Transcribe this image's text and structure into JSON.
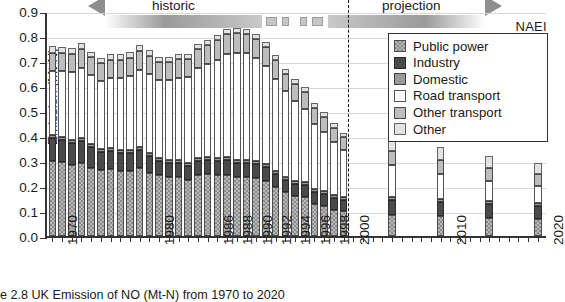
{
  "chart_data": {
    "type": "bar",
    "stacked": true,
    "xlabel": "",
    "ylabel": "Emission (Mt-N)",
    "ylim": [
      0.0,
      0.9
    ],
    "ytick_labels": [
      "0.0",
      "0.1",
      "0.2",
      "0.3",
      "0.4",
      "0.5",
      "0.6",
      "0.7",
      "0.8",
      "0.9"
    ],
    "ytick_values": [
      0.0,
      0.1,
      0.2,
      0.3,
      0.4,
      0.5,
      0.6,
      0.7,
      0.8,
      0.9
    ],
    "grid": true,
    "legend_position": "top-right",
    "series_order": [
      "Public power",
      "Industry",
      "Domestic",
      "Road transport",
      "Other transport",
      "Other"
    ],
    "series_colors": {
      "Public power": "#b8b8b8",
      "Industry": "#4a4a4a",
      "Domestic": "#9a9a9a",
      "Road transport": "#ffffff",
      "Other transport": "#bdbdbd",
      "Other": "#e2e2e2"
    },
    "x": [
      1970,
      1971,
      1972,
      1973,
      1974,
      1975,
      1976,
      1977,
      1978,
      1979,
      1980,
      1981,
      1982,
      1983,
      1984,
      1985,
      1986,
      1987,
      1988,
      1989,
      1990,
      1991,
      1992,
      1993,
      1994,
      1995,
      1996,
      1997,
      1998,
      1999,
      2000,
      2005,
      2010,
      2015,
      2020
    ],
    "xtick_labels": [
      "1970",
      "1980",
      "1986",
      "1988",
      "1990",
      "1992",
      "1994",
      "1996",
      "1998",
      "2000",
      "2010",
      "2020"
    ],
    "series": [
      {
        "name": "Public power",
        "values": [
          0.3,
          0.298,
          0.286,
          0.292,
          0.274,
          0.264,
          0.268,
          0.262,
          0.262,
          0.272,
          0.253,
          0.243,
          0.236,
          0.235,
          0.226,
          0.243,
          0.248,
          0.245,
          0.245,
          0.238,
          0.235,
          0.234,
          0.222,
          0.198,
          0.176,
          0.16,
          0.156,
          0.128,
          0.12,
          0.105,
          0.1,
          0.085,
          0.08,
          0.072,
          0.068
        ]
      },
      {
        "name": "Industry",
        "values": [
          0.092,
          0.088,
          0.086,
          0.088,
          0.082,
          0.074,
          0.074,
          0.072,
          0.072,
          0.074,
          0.066,
          0.058,
          0.056,
          0.056,
          0.054,
          0.056,
          0.056,
          0.057,
          0.058,
          0.056,
          0.056,
          0.055,
          0.054,
          0.052,
          0.05,
          0.05,
          0.05,
          0.048,
          0.047,
          0.046,
          0.045,
          0.06,
          0.058,
          0.056,
          0.054
        ]
      },
      {
        "name": "Domestic",
        "values": [
          0.012,
          0.012,
          0.012,
          0.012,
          0.012,
          0.012,
          0.012,
          0.012,
          0.012,
          0.012,
          0.012,
          0.012,
          0.012,
          0.012,
          0.012,
          0.012,
          0.012,
          0.012,
          0.012,
          0.012,
          0.012,
          0.012,
          0.012,
          0.012,
          0.012,
          0.012,
          0.012,
          0.012,
          0.012,
          0.012,
          0.012,
          0.012,
          0.012,
          0.012,
          0.012
        ]
      },
      {
        "name": "Road transport",
        "values": [
          0.255,
          0.262,
          0.272,
          0.28,
          0.276,
          0.272,
          0.28,
          0.288,
          0.296,
          0.308,
          0.316,
          0.312,
          0.32,
          0.33,
          0.345,
          0.36,
          0.372,
          0.39,
          0.412,
          0.428,
          0.428,
          0.41,
          0.394,
          0.368,
          0.342,
          0.318,
          0.292,
          0.262,
          0.238,
          0.212,
          0.186,
          0.128,
          0.1,
          0.082,
          0.068
        ]
      },
      {
        "name": "Other transport",
        "values": [
          0.075,
          0.072,
          0.074,
          0.076,
          0.072,
          0.07,
          0.072,
          0.072,
          0.072,
          0.076,
          0.074,
          0.072,
          0.072,
          0.074,
          0.072,
          0.076,
          0.078,
          0.08,
          0.08,
          0.08,
          0.078,
          0.078,
          0.076,
          0.074,
          0.07,
          0.068,
          0.066,
          0.062,
          0.06,
          0.056,
          0.052,
          0.056,
          0.054,
          0.05,
          0.048
        ]
      },
      {
        "name": "Other",
        "values": [
          0.026,
          0.025,
          0.024,
          0.024,
          0.022,
          0.02,
          0.022,
          0.022,
          0.022,
          0.022,
          0.022,
          0.021,
          0.02,
          0.02,
          0.02,
          0.02,
          0.02,
          0.02,
          0.02,
          0.02,
          0.02,
          0.02,
          0.02,
          0.02,
          0.02,
          0.02,
          0.02,
          0.02,
          0.02,
          0.02,
          0.018,
          0.058,
          0.052,
          0.048,
          0.044
        ]
      }
    ],
    "totals": [
      0.76,
      0.757,
      0.754,
      0.772,
      0.738,
      0.712,
      0.728,
      0.728,
      0.736,
      0.764,
      0.743,
      0.718,
      0.716,
      0.727,
      0.729,
      0.767,
      0.786,
      0.804,
      0.827,
      0.834,
      0.829,
      0.809,
      0.778,
      0.724,
      0.67,
      0.628,
      0.596,
      0.532,
      0.497,
      0.451,
      0.413,
      0.399,
      0.356,
      0.32,
      0.294
    ],
    "annotations": [
      {
        "text": "historic",
        "type": "phase-arrow",
        "direction": "left"
      },
      {
        "text": "projection",
        "type": "phase-arrow",
        "direction": "right"
      },
      {
        "text": "NAEI",
        "type": "source-label"
      }
    ]
  },
  "axes": {
    "ylabel": "Emission (Mt-N)",
    "yticks": [
      "0.9",
      "0.8",
      "0.7",
      "0.6",
      "0.5",
      "0.4",
      "0.3",
      "0.2",
      "0.1",
      "0.0"
    ],
    "xticks": [
      "1970",
      "1980",
      "1986",
      "1988",
      "1990",
      "1992",
      "1994",
      "1996",
      "1998",
      "2000",
      "2010",
      "2020"
    ]
  },
  "legend": {
    "items": [
      {
        "label": "Public power",
        "swatch": "checkered-gray"
      },
      {
        "label": "Industry",
        "swatch": "dark-gray"
      },
      {
        "label": "Domestic",
        "swatch": "mid-gray"
      },
      {
        "label": "Road transport",
        "swatch": "white"
      },
      {
        "label": "Other transport",
        "swatch": "light-gray"
      },
      {
        "label": "Other",
        "swatch": "very-light-gray"
      }
    ]
  },
  "annotations": {
    "historic": "historic",
    "projection": "projection",
    "naei": "NAEI"
  },
  "caption": {
    "text": "e 2.8 UK Emission of NO  (Mt-N) from 1970 to 2020"
  }
}
